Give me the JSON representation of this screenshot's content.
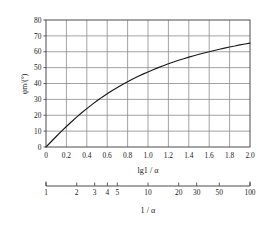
{
  "chart_data": {
    "type": "line",
    "title": "",
    "xlabel": "lg1 / α",
    "ylabel": "φm/(°)",
    "xlim": [
      0,
      2.0
    ],
    "ylim": [
      0,
      80
    ],
    "grid": true,
    "legend": null,
    "x_ticks": [
      "0",
      "0.2",
      "0.4",
      "0.6",
      "0.8",
      "1.0",
      "1.2",
      "1.4",
      "1.6",
      "1.8",
      "2.0"
    ],
    "x_tick_values": [
      0,
      0.2,
      0.4,
      0.6,
      0.8,
      1.0,
      1.2,
      1.4,
      1.6,
      1.8,
      2.0
    ],
    "y_ticks": [
      "0",
      "10",
      "20",
      "30",
      "40",
      "50",
      "60",
      "70",
      "80"
    ],
    "y_tick_values": [
      0,
      10,
      20,
      30,
      40,
      50,
      60,
      70,
      80
    ],
    "secondary_axis": {
      "label": "1 / α",
      "scale": "log",
      "ticks": [
        "1",
        "2",
        "3",
        "4",
        "5",
        "10",
        "20",
        "30",
        "50",
        "100"
      ],
      "tick_values": [
        1,
        2,
        3,
        4,
        5,
        10,
        20,
        30,
        50,
        100
      ]
    },
    "series": [
      {
        "name": "phase margin",
        "x": [
          0.0,
          0.05,
          0.1,
          0.15,
          0.2,
          0.25,
          0.3,
          0.35,
          0.4,
          0.45,
          0.5,
          0.55,
          0.6,
          0.65,
          0.7,
          0.75,
          0.8,
          0.85,
          0.9,
          0.95,
          1.0,
          1.05,
          1.1,
          1.15,
          1.2,
          1.25,
          1.3,
          1.35,
          1.4,
          1.45,
          1.5,
          1.55,
          1.6,
          1.65,
          1.7,
          1.75,
          1.8,
          1.85,
          1.9,
          1.95,
          2.0
        ],
        "y": [
          0.0,
          3.3,
          6.6,
          9.8,
          12.9,
          15.9,
          18.8,
          21.6,
          24.2,
          26.7,
          29.1,
          31.4,
          33.5,
          35.6,
          37.5,
          39.4,
          41.1,
          42.8,
          44.4,
          45.9,
          47.3,
          48.7,
          50.0,
          51.2,
          52.4,
          53.5,
          54.6,
          55.6,
          56.6,
          57.5,
          58.4,
          59.2,
          60.0,
          60.8,
          61.6,
          62.3,
          63.0,
          63.6,
          64.3,
          64.9,
          65.4
        ]
      }
    ],
    "colors": {
      "curve": "#1a1a1a",
      "grid": "#8c8c8c",
      "frame": "#595959",
      "background": "#ffffff"
    }
  }
}
